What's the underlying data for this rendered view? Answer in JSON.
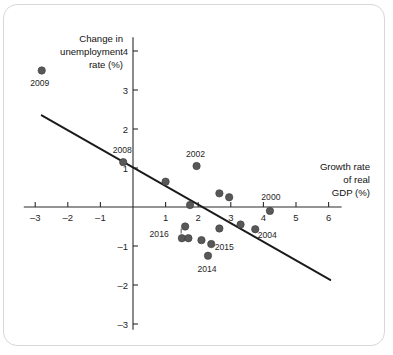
{
  "figure": {
    "frame_color": "#d8d8d8",
    "background": "#ffffff",
    "point_color": "#585858",
    "line_color": "#1a1a1a"
  },
  "axes": {
    "y_title_line1": "Change in",
    "y_title_line2": "unemployment",
    "y_title_line3": "rate (%)",
    "x_title_line1": "Growth rate",
    "x_title_line2": "of real",
    "x_title_line3": "GDP (%)",
    "x_ticks": [
      "-3",
      "-2",
      "-1",
      "1",
      "2",
      "3",
      "4",
      "5",
      "6"
    ],
    "y_ticks": [
      "4",
      "3",
      "2",
      "1",
      "-1",
      "-2",
      "-3"
    ]
  },
  "chart_data": {
    "type": "scatter",
    "title": "",
    "xlabel": "Growth rate of real GDP (%)",
    "ylabel": "Change in unemployment rate (%)",
    "xlim": [
      -3.4,
      6.4
    ],
    "ylim": [
      -3.2,
      4.3
    ],
    "grid": false,
    "legend": "none",
    "x_ticks": [
      -3,
      -2,
      -1,
      1,
      2,
      3,
      4,
      5,
      6
    ],
    "y_ticks": [
      4,
      3,
      2,
      1,
      -1,
      -2,
      -3
    ],
    "points": [
      {
        "label": "2009",
        "x": -2.8,
        "y": 3.5,
        "label_dx": -2,
        "label_dy": 15,
        "leader": false
      },
      {
        "label": "2008",
        "x": -0.3,
        "y": 1.15,
        "label_dx": -1,
        "label_dy": -9,
        "leader": false
      },
      {
        "label": "",
        "x": 1.0,
        "y": 0.65,
        "label_dx": 0,
        "label_dy": 0,
        "leader": false
      },
      {
        "label": "2002",
        "x": 1.95,
        "y": 1.05,
        "label_dx": -1,
        "label_dy": -9,
        "leader": false
      },
      {
        "label": "",
        "x": 1.75,
        "y": 0.05,
        "label_dx": 0,
        "label_dy": 0,
        "leader": false
      },
      {
        "label": "",
        "x": 2.65,
        "y": 0.35,
        "label_dx": 0,
        "label_dy": 0,
        "leader": false
      },
      {
        "label": "",
        "x": 2.95,
        "y": 0.25,
        "label_dx": 0,
        "label_dy": 0,
        "leader": false
      },
      {
        "label": "2016",
        "x": 1.6,
        "y": -0.5,
        "label_dx": -26,
        "label_dy": 10,
        "leader": true
      },
      {
        "label": "",
        "x": 1.5,
        "y": -0.8,
        "label_dx": 0,
        "label_dy": 0,
        "leader": false
      },
      {
        "label": "",
        "x": 1.7,
        "y": -0.8,
        "label_dx": 0,
        "label_dy": 0,
        "leader": false
      },
      {
        "label": "",
        "x": 2.1,
        "y": -0.85,
        "label_dx": 0,
        "label_dy": 0,
        "leader": false
      },
      {
        "label": "2015",
        "x": 2.4,
        "y": -0.95,
        "label_dx": 13,
        "label_dy": 6,
        "leader": false
      },
      {
        "label": "2014",
        "x": 2.3,
        "y": -1.25,
        "label_dx": -1,
        "label_dy": 16,
        "leader": false
      },
      {
        "label": "",
        "x": 2.65,
        "y": -0.55,
        "label_dx": 0,
        "label_dy": 0,
        "leader": false
      },
      {
        "label": "",
        "x": 3.3,
        "y": -0.45,
        "label_dx": 0,
        "label_dy": 0,
        "leader": false
      },
      {
        "label": "2004",
        "x": 3.75,
        "y": -0.57,
        "label_dx": 12,
        "label_dy": 9,
        "leader": false
      },
      {
        "label": "2000",
        "x": 4.2,
        "y": -0.1,
        "label_dx": 1,
        "label_dy": -11,
        "leader": false
      }
    ],
    "trendline": {
      "x0": -2.8,
      "y0": 2.35,
      "x1": 6.05,
      "y1": -1.87,
      "note": "downward-sloping fitted Okun's law line"
    }
  }
}
